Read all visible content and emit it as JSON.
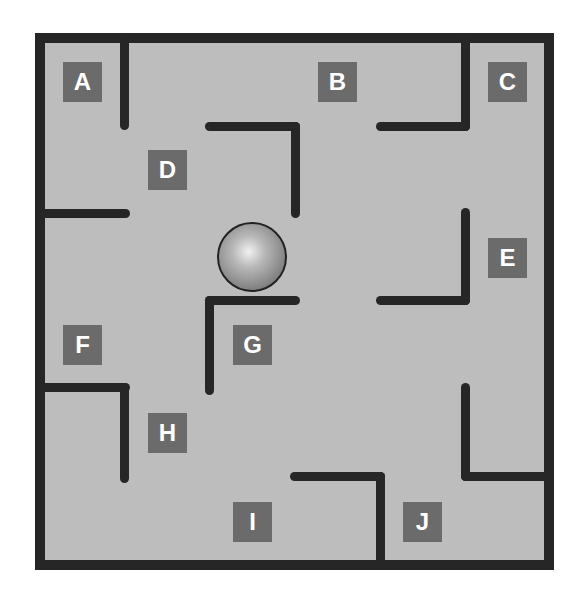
{
  "maze": {
    "colors": {
      "floor": "#bdbdbd",
      "wall": "#262626",
      "label_bg": "#6b6b6b",
      "label_text": "#ffffff"
    },
    "rooms": [
      {
        "id": "A",
        "label": "A"
      },
      {
        "id": "B",
        "label": "B"
      },
      {
        "id": "C",
        "label": "C"
      },
      {
        "id": "D",
        "label": "D"
      },
      {
        "id": "E",
        "label": "E"
      },
      {
        "id": "F",
        "label": "F"
      },
      {
        "id": "G",
        "label": "G"
      },
      {
        "id": "H",
        "label": "H"
      },
      {
        "id": "I",
        "label": "I"
      },
      {
        "id": "J",
        "label": "J"
      }
    ],
    "ball": {
      "icon": "sphere-ball"
    }
  }
}
